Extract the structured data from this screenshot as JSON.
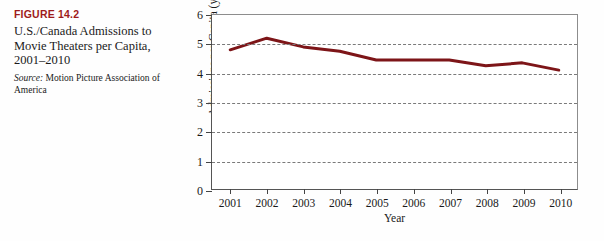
{
  "caption": {
    "figure_number": "FIGURE 14.2",
    "title": "U.S./Canada Admissions to Movie Theaters per Capita, 2001–2010",
    "source_label": "Source:",
    "source_text": " Motion Picture Association of America",
    "accent_color": "#9e1b1b"
  },
  "chart_data": {
    "type": "line",
    "title": "U.S./Canada Admissions to Movie Theaters per Capita, 2001–2010",
    "xlabel": "Year",
    "ylabel": "Admissions per Capita (yearly)",
    "categories": [
      "2001",
      "2002",
      "2003",
      "2004",
      "2005",
      "2006",
      "2007",
      "2008",
      "2009",
      "2010"
    ],
    "x": [
      2001,
      2002,
      2003,
      2004,
      2005,
      2006,
      2007,
      2008,
      2009,
      2010
    ],
    "values": [
      4.8,
      5.2,
      4.9,
      4.75,
      4.45,
      4.45,
      4.45,
      4.25,
      4.35,
      4.1
    ],
    "ylim": [
      0,
      6
    ],
    "yticks": [
      0,
      1,
      2,
      3,
      4,
      5,
      6
    ],
    "ytick_labels": [
      "0",
      "1",
      "2",
      "3",
      "4",
      "5",
      "6"
    ],
    "grid": "horizontal-dashed",
    "legend": "none",
    "line_color": "#7d1518",
    "grid_color": "#7a7a7a",
    "series": [
      {
        "name": "Admissions per Capita (yearly)",
        "values": [
          4.8,
          5.2,
          4.9,
          4.75,
          4.45,
          4.45,
          4.45,
          4.25,
          4.35,
          4.1
        ]
      }
    ]
  }
}
